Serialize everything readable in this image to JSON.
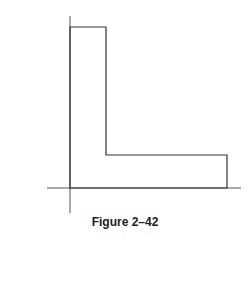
{
  "figure": {
    "caption": "Figure 2–42",
    "shape": "L-shaped area",
    "colors": {
      "stroke": "#333333",
      "axis": "#555555",
      "background": "#ffffff"
    },
    "axes": {
      "x_axis": {
        "x1": 47,
        "x2": 241,
        "y": 188
      },
      "y_axis": {
        "x": 70,
        "y1": 16,
        "y2": 213
      }
    },
    "outline_points": [
      [
        70,
        27
      ],
      [
        106,
        27
      ],
      [
        106,
        155
      ],
      [
        227,
        155
      ],
      [
        227,
        188
      ],
      [
        70,
        188
      ]
    ]
  }
}
